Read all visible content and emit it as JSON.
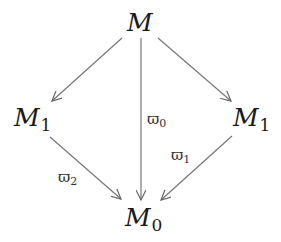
{
  "diagram": {
    "type": "commutative-diagram",
    "nodes": {
      "top": {
        "symbol": "M",
        "sub": ""
      },
      "left": {
        "symbol": "M",
        "sub": "1"
      },
      "right": {
        "symbol": "M",
        "sub": "1"
      },
      "bottom": {
        "symbol": "M",
        "sub": "0"
      }
    },
    "edges": [
      {
        "from": "top",
        "to": "left",
        "label": "",
        "sub": ""
      },
      {
        "from": "top",
        "to": "right",
        "label": "",
        "sub": ""
      },
      {
        "from": "top",
        "to": "bottom",
        "label": "ϖ",
        "sub": "0"
      },
      {
        "from": "left",
        "to": "bottom",
        "label": "ϖ",
        "sub": "2"
      },
      {
        "from": "right",
        "to": "bottom",
        "label": "ϖ",
        "sub": "1"
      }
    ],
    "colors": {
      "text": "#1a1a1a",
      "arrow": "#666666",
      "background": "#ffffff"
    }
  }
}
